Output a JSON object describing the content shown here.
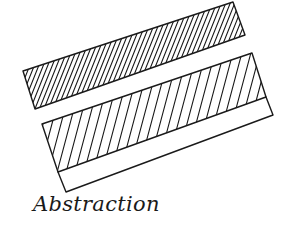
{
  "sketch": {
    "caption": "Abstraction",
    "ink_color": "#1a1a1a",
    "background": "#ffffff",
    "shapes": [
      {
        "name": "upper-band",
        "hatch": "dense",
        "points": [
          [
            23,
            71
          ],
          [
            233,
            2
          ],
          [
            245,
            35
          ],
          [
            35,
            109
          ]
        ]
      },
      {
        "name": "lower-band-hatched",
        "hatch": "sparse",
        "points": [
          [
            42,
            124
          ],
          [
            252,
            53
          ],
          [
            266,
            97
          ],
          [
            58,
            172
          ]
        ]
      },
      {
        "name": "lower-band-plain",
        "hatch": "none",
        "points": [
          [
            58,
            172
          ],
          [
            266,
            97
          ],
          [
            273,
            115
          ],
          [
            66,
            192
          ]
        ]
      }
    ]
  }
}
